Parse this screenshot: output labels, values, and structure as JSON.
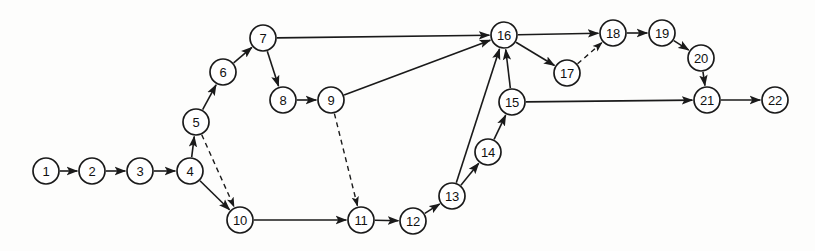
{
  "diagram": {
    "type": "node-link-diagram",
    "background_color": "#fdfdfc",
    "stroke_color": "#1a1a1a",
    "node_fill_color": "#ffffff",
    "node_radius": 13,
    "canvas": {
      "width": 815,
      "height": 251
    },
    "nodes": [
      {
        "id": 1,
        "label": "1",
        "x": 46,
        "y": 171
      },
      {
        "id": 2,
        "label": "2",
        "x": 92,
        "y": 171
      },
      {
        "id": 3,
        "label": "3",
        "x": 140,
        "y": 171
      },
      {
        "id": 4,
        "label": "4",
        "x": 190,
        "y": 171
      },
      {
        "id": 5,
        "label": "5",
        "x": 196,
        "y": 122
      },
      {
        "id": 6,
        "label": "6",
        "x": 223,
        "y": 72
      },
      {
        "id": 7,
        "label": "7",
        "x": 263,
        "y": 38
      },
      {
        "id": 8,
        "label": "8",
        "x": 283,
        "y": 100
      },
      {
        "id": 9,
        "label": "9",
        "x": 331,
        "y": 100
      },
      {
        "id": 10,
        "label": "10",
        "x": 240,
        "y": 220
      },
      {
        "id": 11,
        "label": "11",
        "x": 361,
        "y": 220
      },
      {
        "id": 12,
        "label": "12",
        "x": 413,
        "y": 221
      },
      {
        "id": 13,
        "label": "13",
        "x": 452,
        "y": 196
      },
      {
        "id": 14,
        "label": "14",
        "x": 488,
        "y": 152
      },
      {
        "id": 15,
        "label": "15",
        "x": 512,
        "y": 102
      },
      {
        "id": 16,
        "label": "16",
        "x": 504,
        "y": 35
      },
      {
        "id": 17,
        "label": "17",
        "x": 567,
        "y": 73
      },
      {
        "id": 18,
        "label": "18",
        "x": 613,
        "y": 33
      },
      {
        "id": 19,
        "label": "19",
        "x": 662,
        "y": 33
      },
      {
        "id": 20,
        "label": "20",
        "x": 701,
        "y": 58
      },
      {
        "id": 21,
        "label": "21",
        "x": 707,
        "y": 100
      },
      {
        "id": 22,
        "label": "22",
        "x": 775,
        "y": 100
      }
    ],
    "edges": [
      {
        "from": 1,
        "to": 2,
        "style": "solid",
        "arrow": true
      },
      {
        "from": 2,
        "to": 3,
        "style": "solid",
        "arrow": true
      },
      {
        "from": 3,
        "to": 4,
        "style": "solid",
        "arrow": true
      },
      {
        "from": 4,
        "to": 5,
        "style": "solid",
        "arrow": true
      },
      {
        "from": 4,
        "to": 10,
        "style": "solid",
        "arrow": true
      },
      {
        "from": 5,
        "to": 6,
        "style": "solid",
        "arrow": true
      },
      {
        "from": 5,
        "to": 10,
        "style": "dashed",
        "arrow": true
      },
      {
        "from": 6,
        "to": 7,
        "style": "solid",
        "arrow": true
      },
      {
        "from": 7,
        "to": 8,
        "style": "solid",
        "arrow": true
      },
      {
        "from": 7,
        "to": 16,
        "style": "solid",
        "arrow": true
      },
      {
        "from": 8,
        "to": 9,
        "style": "solid",
        "arrow": true
      },
      {
        "from": 9,
        "to": 16,
        "style": "solid",
        "arrow": true
      },
      {
        "from": 9,
        "to": 11,
        "style": "dashed",
        "arrow": true
      },
      {
        "from": 10,
        "to": 11,
        "style": "solid",
        "arrow": true
      },
      {
        "from": 11,
        "to": 12,
        "style": "solid",
        "arrow": true
      },
      {
        "from": 12,
        "to": 13,
        "style": "solid",
        "arrow": true
      },
      {
        "from": 13,
        "to": 14,
        "style": "solid",
        "arrow": true
      },
      {
        "from": 13,
        "to": 16,
        "style": "solid",
        "arrow": true
      },
      {
        "from": 14,
        "to": 15,
        "style": "solid",
        "arrow": true
      },
      {
        "from": 15,
        "to": 16,
        "style": "solid",
        "arrow": true
      },
      {
        "from": 15,
        "to": 21,
        "style": "solid",
        "arrow": true
      },
      {
        "from": 16,
        "to": 17,
        "style": "solid",
        "arrow": true
      },
      {
        "from": 16,
        "to": 18,
        "style": "solid",
        "arrow": true
      },
      {
        "from": 17,
        "to": 18,
        "style": "dashed",
        "arrow": true
      },
      {
        "from": 18,
        "to": 19,
        "style": "solid",
        "arrow": true
      },
      {
        "from": 19,
        "to": 20,
        "style": "solid",
        "arrow": true
      },
      {
        "from": 20,
        "to": 21,
        "style": "solid",
        "arrow": true
      },
      {
        "from": 21,
        "to": 22,
        "style": "solid",
        "arrow": true
      }
    ]
  }
}
